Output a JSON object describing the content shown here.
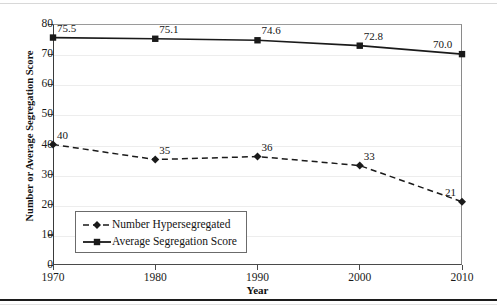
{
  "chart_data": {
    "type": "line",
    "title": "",
    "xlabel": "Year",
    "ylabel": "Number or Average Segregation Score",
    "x": [
      1970,
      1980,
      1990,
      2000,
      2010
    ],
    "xtick_labels": [
      "1970",
      "1980",
      "1990",
      "2000",
      "2010"
    ],
    "ytick_labels": [
      "0",
      "10",
      "20",
      "30",
      "40",
      "50",
      "60",
      "70",
      "80"
    ],
    "yticks": [
      0,
      10,
      20,
      30,
      40,
      50,
      60,
      70,
      80
    ],
    "ylim": [
      0,
      80
    ],
    "xlim": [
      1970,
      2010
    ],
    "grid": "horizontal",
    "legend_position": "lower-left-inside",
    "series": [
      {
        "name": "Number Hypersegregated",
        "marker": "diamond",
        "linestyle": "dashed",
        "color": "#1a1a1a",
        "values": [
          40,
          35,
          36,
          33,
          21
        ],
        "data_labels": [
          "40",
          "35",
          "36",
          "33",
          "21"
        ]
      },
      {
        "name": "Average Segregation Score",
        "marker": "square",
        "linestyle": "solid",
        "color": "#1a1a1a",
        "values": [
          75.5,
          75.1,
          74.6,
          72.8,
          70.0
        ],
        "data_labels": [
          "75.5",
          "75.1",
          "74.6",
          "72.8",
          "70.0"
        ]
      }
    ]
  },
  "legend": {
    "items": [
      {
        "label": "Number Hypersegregated",
        "marker": "diamond",
        "linestyle": "dashed"
      },
      {
        "label": "Average Segregation Score",
        "marker": "square",
        "linestyle": "solid"
      }
    ]
  },
  "colors": {
    "line": "#1a1a1a",
    "gridline": "#ededed",
    "axis": "#4a4a4a",
    "background": "#ffffff"
  }
}
